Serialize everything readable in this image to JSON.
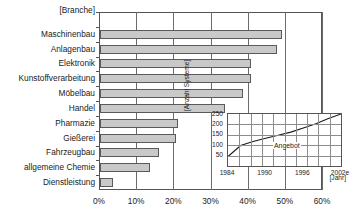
{
  "chart_data": {
    "type": "bar",
    "orientation": "horizontal",
    "title": "",
    "xlabel": "",
    "ylabel": "[Branche]",
    "axis_corner_label": "[Branche]",
    "xlim": [
      0,
      60
    ],
    "grid": true,
    "xticks": [
      "0%",
      "10%",
      "20%",
      "30%",
      "40%",
      "50%",
      "60%"
    ],
    "xtick_values": [
      0,
      10,
      20,
      30,
      40,
      50,
      60
    ],
    "categories": [
      "Maschinenbau",
      "Anlagenbau",
      "Elektronik",
      "Kunstoffverarbeitung",
      "Möbelbau",
      "Handel",
      "Pharmazie",
      "Gießerei",
      "Fahrzeugbau",
      "allgemeine Chemie",
      "Dienstleistung"
    ],
    "values": [
      49,
      47.5,
      40.5,
      40.5,
      38.5,
      33.5,
      21,
      20.5,
      16,
      13.5,
      3.5
    ],
    "bar_color": "#c9c9c9",
    "bar_border_color": "#5a5a5a",
    "inset": {
      "type": "line",
      "title": "",
      "xlabel": "[Jahr]",
      "ylabel": "[Anzahl Systeme]",
      "xlim": [
        1984,
        2002
      ],
      "ylim": [
        0,
        250
      ],
      "grid": true,
      "xticks": [
        "1984",
        "1990",
        "1996",
        "2002e"
      ],
      "xtick_values": [
        1984,
        1990,
        1996,
        2002
      ],
      "yticks": [
        "50",
        "100",
        "150",
        "200",
        "250"
      ],
      "ytick_values": [
        50,
        100,
        150,
        200,
        250
      ],
      "series": [
        {
          "name": "Angebot",
          "x": [
            1984,
            1985,
            1986,
            1987,
            1988,
            1990,
            1992,
            1994,
            1996,
            1998,
            2000,
            2002
          ],
          "values": [
            45,
            72,
            98,
            108,
            118,
            133,
            148,
            163,
            183,
            203,
            228,
            250
          ]
        }
      ],
      "annotation": "Angebot"
    }
  }
}
